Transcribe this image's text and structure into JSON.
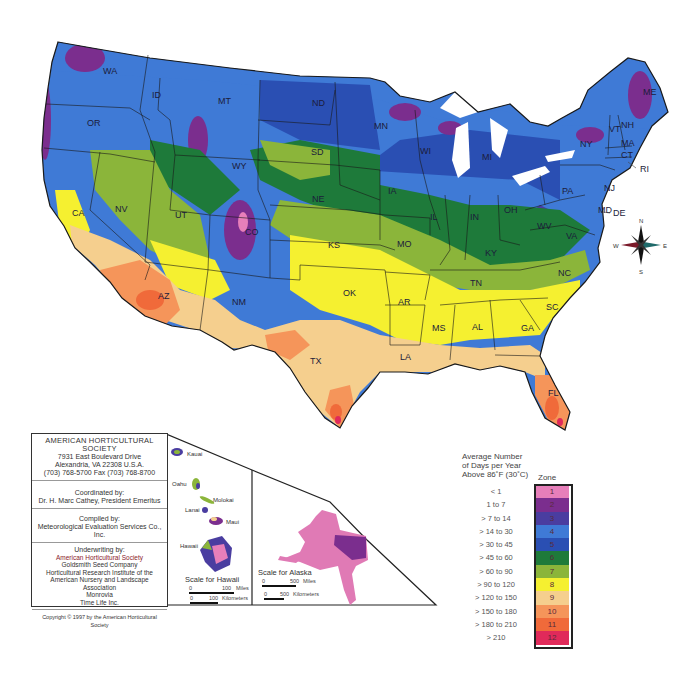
{
  "map": {
    "title": "Heat Zone Map",
    "state_labels": [
      {
        "id": "WA",
        "x": 103,
        "y": 74
      },
      {
        "id": "OR",
        "x": 87,
        "y": 126
      },
      {
        "id": "CA",
        "x": 72,
        "y": 216
      },
      {
        "id": "NV",
        "x": 115,
        "y": 212
      },
      {
        "id": "ID",
        "x": 152,
        "y": 98
      },
      {
        "id": "MT",
        "x": 218,
        "y": 104
      },
      {
        "id": "WY",
        "x": 232,
        "y": 169
      },
      {
        "id": "UT",
        "x": 175,
        "y": 218
      },
      {
        "id": "CO",
        "x": 245,
        "y": 235
      },
      {
        "id": "AZ",
        "x": 158,
        "y": 299
      },
      {
        "id": "NM",
        "x": 232,
        "y": 305
      },
      {
        "id": "ND",
        "x": 312,
        "y": 106
      },
      {
        "id": "SD",
        "x": 311,
        "y": 155
      },
      {
        "id": "NE",
        "x": 312,
        "y": 202
      },
      {
        "id": "KS",
        "x": 328,
        "y": 248
      },
      {
        "id": "OK",
        "x": 343,
        "y": 296
      },
      {
        "id": "TX",
        "x": 310,
        "y": 364
      },
      {
        "id": "MN",
        "x": 374,
        "y": 129
      },
      {
        "id": "IA",
        "x": 388,
        "y": 194
      },
      {
        "id": "MO",
        "x": 397,
        "y": 247
      },
      {
        "id": "AR",
        "x": 398,
        "y": 305
      },
      {
        "id": "LA",
        "x": 400,
        "y": 360
      },
      {
        "id": "WI",
        "x": 420,
        "y": 154
      },
      {
        "id": "IL",
        "x": 430,
        "y": 220
      },
      {
        "id": "MI",
        "x": 482,
        "y": 160
      },
      {
        "id": "IN",
        "x": 470,
        "y": 220
      },
      {
        "id": "OH",
        "x": 504,
        "y": 213
      },
      {
        "id": "KY",
        "x": 485,
        "y": 256
      },
      {
        "id": "TN",
        "x": 470,
        "y": 286
      },
      {
        "id": "MS",
        "x": 432,
        "y": 331
      },
      {
        "id": "AL",
        "x": 472,
        "y": 330
      },
      {
        "id": "GA",
        "x": 521,
        "y": 331
      },
      {
        "id": "FL",
        "x": 548,
        "y": 396
      },
      {
        "id": "SC",
        "x": 546,
        "y": 310
      },
      {
        "id": "NC",
        "x": 558,
        "y": 276
      },
      {
        "id": "VA",
        "x": 566,
        "y": 239
      },
      {
        "id": "WV",
        "x": 537,
        "y": 229
      },
      {
        "id": "PA",
        "x": 562,
        "y": 194
      },
      {
        "id": "NY",
        "x": 580,
        "y": 147
      },
      {
        "id": "VT",
        "x": 609,
        "y": 132
      },
      {
        "id": "NH",
        "x": 621,
        "y": 128
      },
      {
        "id": "ME",
        "x": 643,
        "y": 95
      },
      {
        "id": "MA",
        "x": 621,
        "y": 146
      },
      {
        "id": "CT",
        "x": 621,
        "y": 158
      },
      {
        "id": "RI",
        "x": 640,
        "y": 172
      },
      {
        "id": "DE",
        "x": 613,
        "y": 216
      },
      {
        "id": "MD",
        "x": 598,
        "y": 213
      },
      {
        "id": "NJ",
        "x": 604,
        "y": 191
      }
    ],
    "compass": {
      "n": "N",
      "s": "S",
      "e": "E",
      "w": "W"
    }
  },
  "info_box": {
    "organization": "AMERICAN HORTICULTURAL SOCIETY",
    "address_line1": "7931 East Boulevard Drive",
    "address_line2": "Alexandria, VA 22308 U.S.A.",
    "phone_fax": "(703) 768-5700 Fax (703) 768-8700",
    "coordinated_label": "Coordinated by:",
    "coordinated_by": "Dr. H. Marc Cathey, President Emeritus",
    "compiled_label": "Compiled by:",
    "compiled_by": "Meteorological Evaluation Services Co., Inc.",
    "underwriting_label": "Underwriting by:",
    "underwriters": [
      "American Horticultural Society",
      "Goldsmith Seed Company",
      "Horticultural Research Institute of the",
      "American Nursery and Landscape Association",
      "Monrovia",
      "Time Life Inc."
    ],
    "copyright": "Copyright © 1997 by the American Horticultural Society"
  },
  "hawaii_inset": {
    "islands": [
      "Kauai",
      "Oahu",
      "Molokai",
      "Lanai",
      "Maui",
      "Hawaii"
    ],
    "scale_title": "Scale for Hawaii",
    "miles_start": "0",
    "miles_end": "100",
    "miles_unit": "Miles",
    "km_start": "0",
    "km_end": "100",
    "km_unit": "Kilometers"
  },
  "alaska_inset": {
    "scale_title": "Scale for Alaska",
    "miles_start": "0",
    "miles_end": "500",
    "miles_unit": "Miles",
    "km_start": "0",
    "km_end": "500",
    "km_unit": "Kilometers"
  },
  "legend": {
    "heading_line1": "Average Number",
    "heading_line2": "of Days per Year",
    "heading_line3": "Above 86˚F (30˚C)",
    "zone_label": "Zone",
    "zones": [
      {
        "zone": "1",
        "range": "< 1",
        "color": "#e77fba"
      },
      {
        "zone": "2",
        "range": "1 to 7",
        "color": "#7b2e8e"
      },
      {
        "zone": "3",
        "range": "> 7 to 14",
        "color": "#4a3da0"
      },
      {
        "zone": "4",
        "range": "> 14 to 30",
        "color": "#3f7ad6"
      },
      {
        "zone": "5",
        "range": "> 30 to 45",
        "color": "#2a4fb3"
      },
      {
        "zone": "6",
        "range": "> 45 to 60",
        "color": "#1e7a3a"
      },
      {
        "zone": "7",
        "range": "> 60 to 90",
        "color": "#8bb53a"
      },
      {
        "zone": "8",
        "range": "> 90 to 120",
        "color": "#f5f030"
      },
      {
        "zone": "9",
        "range": "> 120 to 150",
        "color": "#f5cf8e"
      },
      {
        "zone": "10",
        "range": "> 150 to 180",
        "color": "#f5955a"
      },
      {
        "zone": "11",
        "range": "> 180 to 210",
        "color": "#f06a3a"
      },
      {
        "zone": "12",
        "range": "> 210",
        "color": "#e02a5a"
      }
    ]
  }
}
